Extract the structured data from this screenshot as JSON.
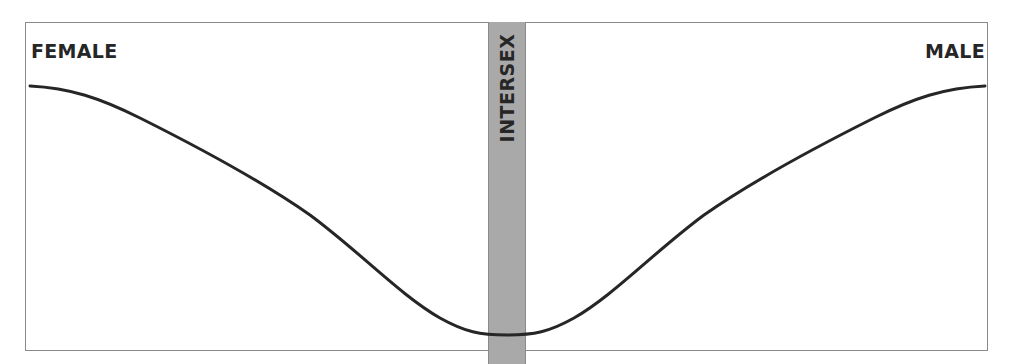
{
  "diagram": {
    "left_label": "FEMALE",
    "right_label": "MALE",
    "center_band_label": "INTERSEX",
    "colors": {
      "frame_border": "#8a8a8a",
      "band_fill": "#a9a9a9",
      "curve_stroke": "#262626",
      "text": "#262626"
    },
    "curve_path": "M30,86 C70,88 100,98 140,118 C200,148 260,180 310,215 C360,252 400,295 440,318 C465,332 480,335 507,335 C534,335 549,332 574,318 C614,295 654,252 704,215 C754,180 814,148 874,118 C914,98 944,88 985,86"
  }
}
